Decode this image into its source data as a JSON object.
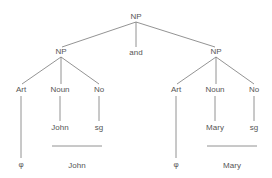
{
  "tree": {
    "root": {
      "label": "NP"
    },
    "conjunction": {
      "label": "and"
    },
    "left_np": {
      "label": "NP",
      "children": [
        {
          "label": "Art",
          "terminal": "φ"
        },
        {
          "label": "Noun",
          "terminal": "John"
        },
        {
          "label": "No",
          "terminal": "sg"
        }
      ],
      "surface": "John"
    },
    "right_np": {
      "label": "NP",
      "children": [
        {
          "label": "Art",
          "terminal": "φ"
        },
        {
          "label": "Noun",
          "terminal": "Mary"
        },
        {
          "label": "No",
          "terminal": "sg"
        }
      ],
      "surface": "Mary"
    }
  },
  "colors": {
    "line": "#777777",
    "text": "#555555",
    "background": "#ffffff"
  }
}
